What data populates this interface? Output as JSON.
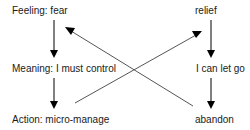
{
  "diagram": {
    "left_column": {
      "nodes": [
        {
          "id": "feeling",
          "label": "Feeling: fear"
        },
        {
          "id": "meaning",
          "label": "Meaning: I must control"
        },
        {
          "id": "action",
          "label": "Action: micro-manage"
        }
      ]
    },
    "right_column": {
      "nodes": [
        {
          "id": "relief",
          "label": "relief"
        },
        {
          "id": "letgo",
          "label": "I can let go"
        },
        {
          "id": "abandon",
          "label": "abandon"
        }
      ]
    },
    "edges": [
      {
        "from": "feeling",
        "to": "meaning",
        "type": "arrow"
      },
      {
        "from": "meaning",
        "to": "action",
        "type": "arrow"
      },
      {
        "from": "relief",
        "to": "letgo",
        "type": "arrow"
      },
      {
        "from": "letgo",
        "to": "abandon",
        "type": "arrow"
      },
      {
        "from": "action",
        "to": "relief",
        "type": "arrow"
      },
      {
        "from": "abandon",
        "to": "feeling",
        "type": "arrow"
      }
    ],
    "colors": {
      "vertical_arrow": "#000000",
      "diagonal_arrow": "#555555",
      "text": "#1a1a1a"
    }
  }
}
